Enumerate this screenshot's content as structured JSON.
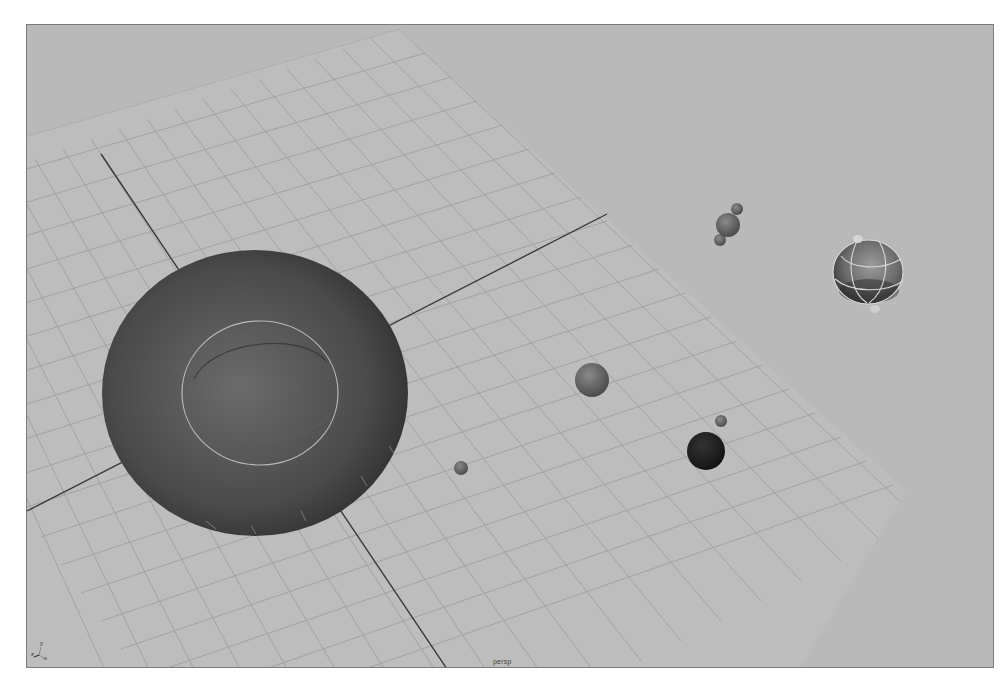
{
  "viewport": {
    "camera_name": "persp",
    "background_color": "#b9b9b9",
    "grid_color": "#a4a4a4",
    "axis_line_color": "#3a3a3a"
  },
  "axis_gizmo": {
    "z_label": "z",
    "y_label": "y",
    "x_label": "x"
  },
  "scene_objects": [
    {
      "name": "large-sphere",
      "shape": "sphere",
      "shade": "dark-gray",
      "selected_wireframe": true
    },
    {
      "name": "medium-sphere",
      "shape": "sphere",
      "shade": "gray"
    },
    {
      "name": "small-sphere",
      "shape": "sphere",
      "shade": "gray"
    },
    {
      "name": "dark-sphere",
      "shape": "sphere",
      "shade": "black"
    },
    {
      "name": "tiny-sphere",
      "shape": "sphere",
      "shade": "gray"
    },
    {
      "name": "molecule-cluster",
      "shape": "sphere-group",
      "shade": "gray"
    },
    {
      "name": "wireframe-globe",
      "shape": "sphere",
      "shade": "gray",
      "selected_wireframe": true
    }
  ]
}
